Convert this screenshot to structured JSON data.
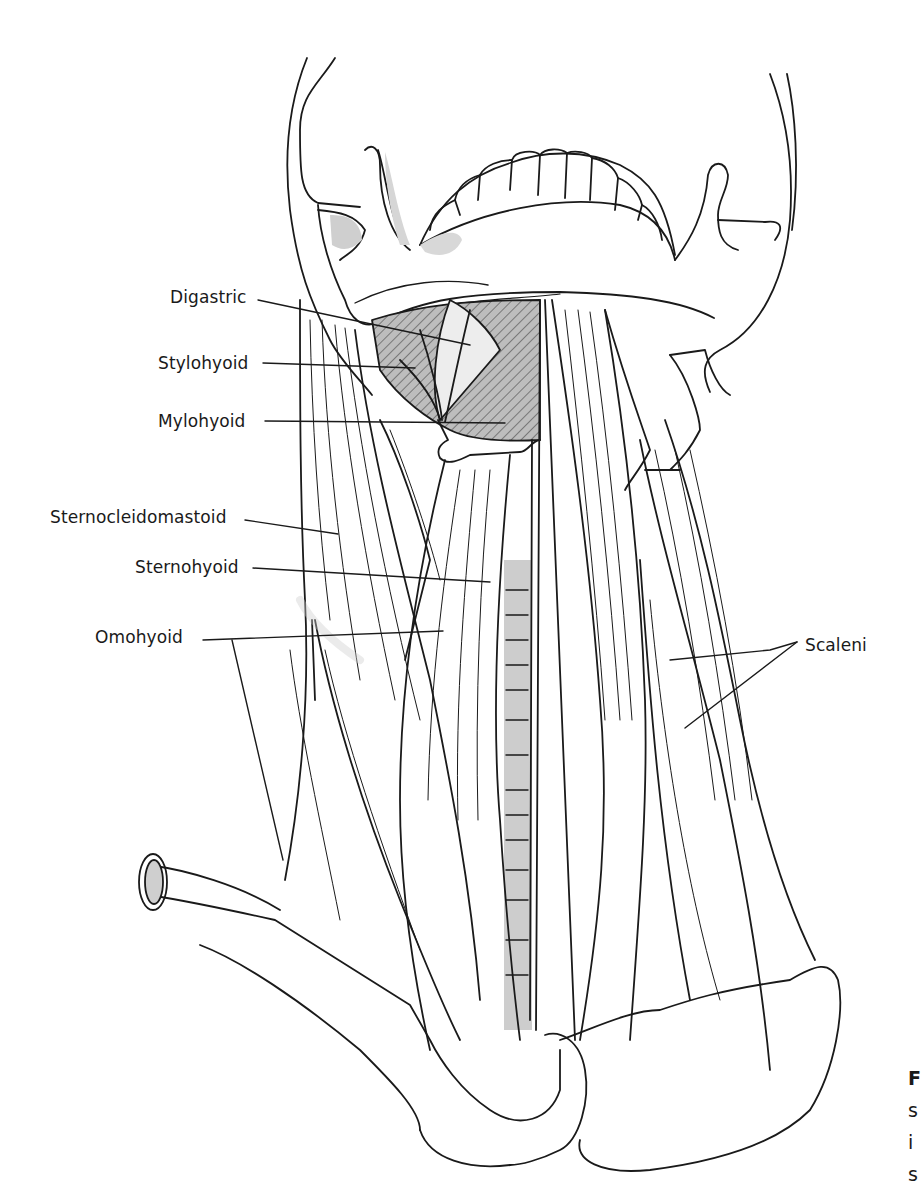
{
  "figure": {
    "background": "#ffffff",
    "line_color": "#1a1a1a",
    "shade_color": "#c8c8c8",
    "labels": [
      {
        "id": "digastric",
        "text": "Digastric"
      },
      {
        "id": "stylohyoid",
        "text": "Stylohyoid"
      },
      {
        "id": "mylohyoid",
        "text": "Mylohyoid"
      },
      {
        "id": "sternocleidomastoid",
        "text": "Sternocleidomastoid"
      },
      {
        "id": "sternohyoid",
        "text": "Sternohyoid"
      },
      {
        "id": "omohyoid",
        "text": "Omohyoid"
      },
      {
        "id": "scaleni",
        "text": "Scaleni"
      }
    ],
    "caption_fragments": [
      "F",
      "s",
      "i",
      "s"
    ]
  }
}
